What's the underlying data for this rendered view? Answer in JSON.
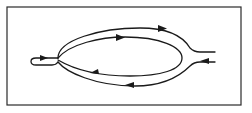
{
  "diagram": {
    "title": "",
    "colors": {
      "stroke": "#1a1a1a",
      "background": "#ffffff",
      "frame": "#2a2a2a"
    },
    "arrows": [
      {
        "id": "left-inlet",
        "direction": "right"
      },
      {
        "id": "outer-top",
        "direction": "right"
      },
      {
        "id": "inner-top",
        "direction": "right"
      },
      {
        "id": "inner-bottom",
        "direction": "left"
      },
      {
        "id": "outer-bottom",
        "direction": "left"
      },
      {
        "id": "right-inlet",
        "direction": "left"
      }
    ]
  }
}
